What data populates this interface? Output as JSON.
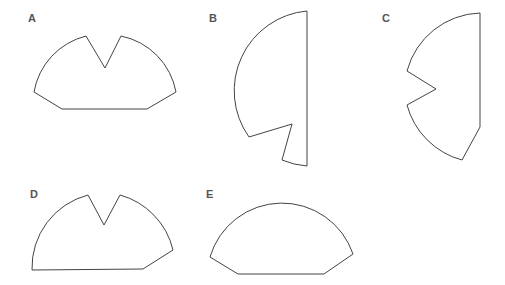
{
  "figure": {
    "options": [
      {
        "letter": "A",
        "description": "half-disc with V-notch at top, beveled bottom corners"
      },
      {
        "letter": "B",
        "description": "half-disc facing left with angled notch at bottom"
      },
      {
        "letter": "C",
        "description": "half-disc facing left with V-notch at left side, beveled bottom-right corner"
      },
      {
        "letter": "D",
        "description": "half-disc with V-notch at top, beveled bottom-right corner only"
      },
      {
        "letter": "E",
        "description": "half-disc with beveled bottom corners, no notch"
      }
    ],
    "colors": {
      "stroke": "#444444",
      "label": "#555555",
      "background": "#ffffff"
    }
  }
}
